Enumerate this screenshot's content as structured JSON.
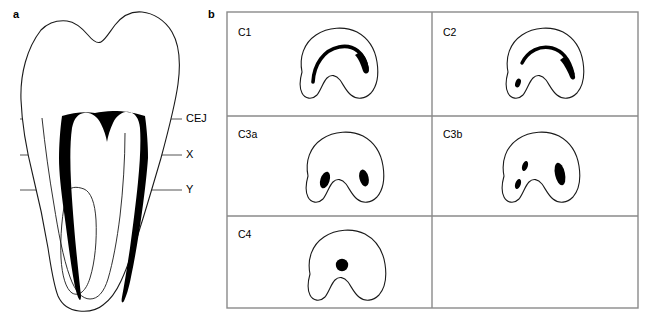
{
  "figure": {
    "panels": [
      {
        "letter": "a",
        "name": "longitudinal-tooth-section"
      },
      {
        "letter": "b",
        "name": "canal-configuration-grid"
      }
    ]
  },
  "panel_a": {
    "letter": "a",
    "level_lines": [
      {
        "label": "CEJ",
        "y": 119
      },
      {
        "label": "X",
        "y": 155
      },
      {
        "label": "Y",
        "y": 190
      }
    ],
    "structures": [
      {
        "name": "tooth-outline",
        "fill": "#ffffff",
        "stroke": "#1a1a1a"
      },
      {
        "name": "pulp-chamber-and-canals",
        "fill": "#000000"
      },
      {
        "name": "root-groove-outline",
        "fill": "none",
        "stroke": "#1a1a1a"
      }
    ]
  },
  "panel_b": {
    "letter": "b",
    "grid": {
      "columns": 2,
      "rows": 3,
      "border_color": "#8a8a8a"
    },
    "cells": [
      {
        "label": "C1",
        "type": "continuous-c-shape",
        "canal_count": 1,
        "occupied": true
      },
      {
        "label": "C2",
        "type": "semicolon-shape",
        "canal_count": 2,
        "occupied": true
      },
      {
        "label": "C3a",
        "type": "two-separate-canals",
        "canal_count": 2,
        "occupied": true
      },
      {
        "label": "C3b",
        "type": "three-separate-canals",
        "canal_count": 3,
        "occupied": true
      },
      {
        "label": "C4",
        "type": "single-round-canal",
        "canal_count": 1,
        "occupied": true
      },
      {
        "label": "",
        "type": "empty",
        "canal_count": 0,
        "occupied": false
      }
    ]
  },
  "colors": {
    "ink": "#000000",
    "outline": "#1a1a1a",
    "grid_border": "#8a8a8a",
    "level_line": "#555555",
    "background": "#ffffff"
  }
}
